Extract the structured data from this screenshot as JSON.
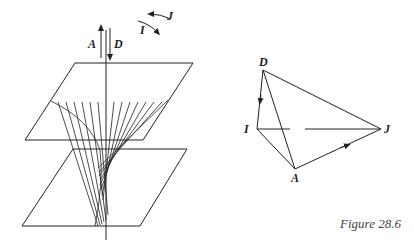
{
  "caption": "Figure 28.6",
  "left_figure": {
    "labels": {
      "A": "A",
      "D": "D",
      "I": "I",
      "J": "J"
    }
  },
  "right_figure": {
    "vertices": {
      "D": "D",
      "I": "I",
      "J": "J",
      "A": "A"
    }
  },
  "colors": {
    "ink": "#222222",
    "background": "#ffffff"
  }
}
